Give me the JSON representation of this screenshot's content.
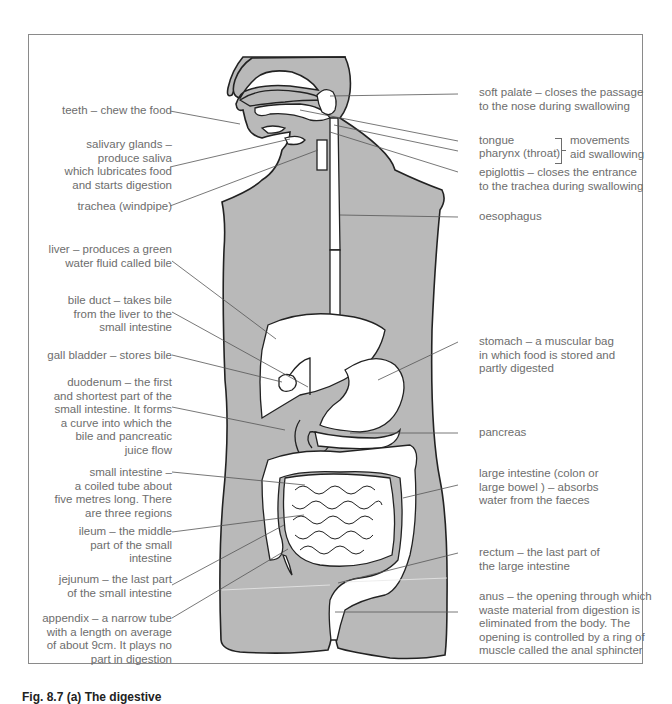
{
  "figure": {
    "caption": "Fig. 8.7 (a) The digestive",
    "colors": {
      "body_fill": "#b9b9b9",
      "outline": "#222222",
      "organ_fill": "#ffffff",
      "label_text": "#6d6d6d",
      "leader_line": "#555555",
      "frame": "#8a8a8a"
    }
  },
  "labels_left": {
    "teeth": [
      "teeth – chew the food"
    ],
    "salivary_glands": [
      "salivary glands –",
      "produce saliva",
      "which lubricates food",
      "and starts digestion"
    ],
    "trachea": [
      "trachea (windpipe)"
    ],
    "liver": [
      "liver – produces a green",
      "water fluid called bile"
    ],
    "bile_duct": [
      "bile duct – takes bile",
      "from the liver to the",
      "small intestine"
    ],
    "gall_bladder": [
      "gall bladder – stores bile"
    ],
    "duodenum": [
      "duodenum – the first",
      "and shortest part of the",
      "small intestine. It forms",
      "a curve into which the",
      "bile and pancreatic",
      "juice flow"
    ],
    "small_intestine": [
      "small intestine –",
      "a coiled tube about",
      "five metres long. There",
      "are three regions"
    ],
    "ileum": [
      "ileum – the middle",
      "part of the small",
      "intestine"
    ],
    "jejunum": [
      "jejunum – the last part",
      "of the small intestine"
    ],
    "appendix": [
      "appendix – a narrow tube",
      "with a length on average",
      "of about 9cm. It plays no",
      "part in digestion"
    ]
  },
  "labels_right": {
    "soft_palate": [
      "soft palate – closes the passage",
      "to the nose during swallowing"
    ],
    "tongue": [
      "tongue"
    ],
    "pharynx": [
      "pharynx (throat)"
    ],
    "movements": [
      "movements",
      "aid swallowing"
    ],
    "epiglottis": [
      "epiglottis – closes the entrance",
      "to the trachea during swallowing"
    ],
    "oesophagus": [
      "oesophagus"
    ],
    "stomach": [
      "stomach – a muscular bag",
      "in which food is stored and",
      "partly digested"
    ],
    "pancreas": [
      "pancreas"
    ],
    "large_intestine": [
      "large intestine (colon or",
      "large bowel ) – absorbs",
      "water from the faeces"
    ],
    "rectum": [
      "rectum – the last part of",
      "the large intestine"
    ],
    "anus": [
      "anus – the opening through which",
      "waste material from digestion is",
      "eliminated from the body. The",
      "opening is controlled by a ring of",
      "muscle called the anal sphincter"
    ]
  }
}
